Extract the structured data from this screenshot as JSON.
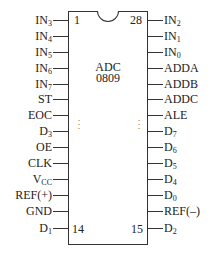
{
  "chip": {
    "name_line1": "ADC",
    "name_line2": "0809",
    "corner_numbers": {
      "top_left": "1",
      "top_right": "28",
      "bottom_left": "14",
      "bottom_right": "15"
    },
    "ellipsis": "⋮"
  },
  "left_pins": [
    {
      "base": "IN",
      "sub": "3"
    },
    {
      "base": "IN",
      "sub": "4"
    },
    {
      "base": "IN",
      "sub": "5"
    },
    {
      "base": "IN",
      "sub": "6"
    },
    {
      "base": "IN",
      "sub": "7"
    },
    {
      "base": "ST",
      "sub": ""
    },
    {
      "base": "EOC",
      "sub": ""
    },
    {
      "base": "D",
      "sub": "3"
    },
    {
      "base": "OE",
      "sub": ""
    },
    {
      "base": "CLK",
      "sub": ""
    },
    {
      "base": "V",
      "sub": "CC"
    },
    {
      "base": "REF(+)",
      "sub": ""
    },
    {
      "base": "GND",
      "sub": ""
    },
    {
      "base": "D",
      "sub": "1"
    }
  ],
  "right_pins": [
    {
      "base": "IN",
      "sub": "2"
    },
    {
      "base": "IN",
      "sub": "1"
    },
    {
      "base": "IN",
      "sub": "0"
    },
    {
      "base": "ADDA",
      "sub": ""
    },
    {
      "base": "ADDB",
      "sub": ""
    },
    {
      "base": "ADDC",
      "sub": ""
    },
    {
      "base": "ALE",
      "sub": ""
    },
    {
      "base": "D",
      "sub": "7"
    },
    {
      "base": "D",
      "sub": "6"
    },
    {
      "base": "D",
      "sub": "5"
    },
    {
      "base": "D",
      "sub": "4"
    },
    {
      "base": "D",
      "sub": "0"
    },
    {
      "base": "REF(–)",
      "sub": ""
    },
    {
      "base": "D",
      "sub": "2"
    }
  ]
}
